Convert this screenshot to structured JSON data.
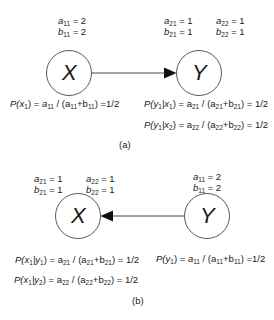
{
  "panel_a": {
    "caption": "(a)",
    "nodes": {
      "x": {
        "letter": "X",
        "params": {
          "a": "11",
          "a_val": "= 2",
          "b": "11",
          "b_val": "= 2"
        }
      },
      "y": {
        "letter": "Y",
        "params_1": {
          "a": "21",
          "a_val": "= 1",
          "b": "21",
          "b_val": "= 1"
        },
        "params_2": {
          "a": "22",
          "a_val": "= 1",
          "b": "22",
          "b_val": "= 1"
        }
      }
    },
    "edge": "X → Y",
    "formulas": {
      "px1": {
        "lhs": "P(x",
        "lhs_sub": "1",
        "lhs_end": ") = ",
        "a": "a",
        "a_sub": "11",
        "mid": " / (a",
        "mid_sub": "11",
        "plus": "+b",
        "plus_sub": "11",
        "rhs": ") =1/2"
      },
      "py1x1": {
        "lhs": "P(y",
        "s1": "1",
        "bar": "|x",
        "s2": "1",
        "close": ") = a",
        "a_sub": "21",
        "mid": " / (a",
        "mid_sub": "21",
        "plus": "+b",
        "plus_sub": "21",
        "rhs": ") = 1/2"
      },
      "py1x2": {
        "lhs": "P(y",
        "s1": "1",
        "bar": "|x",
        "s2": "2",
        "close": ") = a",
        "a_sub": "22",
        "mid": " / (a",
        "mid_sub": "22",
        "plus": "+b",
        "plus_sub": "22",
        "rhs": ") = 1/2"
      }
    }
  },
  "panel_b": {
    "caption": "(b)",
    "nodes": {
      "x": {
        "letter": "X",
        "params_1": {
          "a": "21",
          "a_val": "= 1",
          "b": "21",
          "b_val": "= 1"
        },
        "params_2": {
          "a": "22",
          "a_val": "= 1",
          "b": "22",
          "b_val": "= 1"
        }
      },
      "y": {
        "letter": "Y",
        "params": {
          "a": "11",
          "a_val": "= 2",
          "b": "11",
          "b_val": "= 2"
        }
      }
    },
    "edge": "Y → X",
    "formulas": {
      "px1y1": {
        "lhs": "P(x",
        "s1": "1",
        "bar": "|y",
        "s2": "1",
        "close": ") = a",
        "a_sub": "21",
        "mid": " / (a",
        "mid_sub": "21",
        "plus": "+b",
        "plus_sub": "21",
        "rhs": ") = 1/2"
      },
      "px1y2": {
        "lhs": "P(x",
        "s1": "1",
        "bar": "|y",
        "s2": "2",
        "close": ") = a",
        "a_sub": "22",
        "mid": " / (a",
        "mid_sub": "22",
        "plus": "+b",
        "plus_sub": "22",
        "rhs": ") = 1/2"
      },
      "py1": {
        "lhs": "P(y",
        "lhs_sub": "1",
        "lhs_end": ") = ",
        "a": "a",
        "a_sub": "11",
        "mid": " / (a",
        "mid_sub": "11",
        "plus": "+b",
        "plus_sub": "11",
        "rhs": ") =1/2"
      }
    }
  }
}
